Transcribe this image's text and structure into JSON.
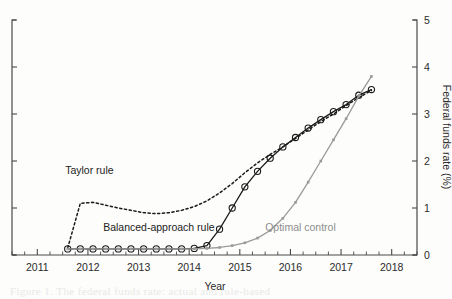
{
  "figure": {
    "background": "#fdfdfc",
    "bleed_text_bottom": "Figure 1. The federal funds rate: actual and rule-based",
    "bleed_text_top": ""
  },
  "chart_data": {
    "type": "line",
    "title": "",
    "xlabel": "Year",
    "ylabel": "Federal funds rate (%)",
    "xlim": [
      2010.5,
      2018.5
    ],
    "ylim": [
      0,
      5
    ],
    "xticks": [
      2011,
      2012,
      2013,
      2014,
      2015,
      2016,
      2017,
      2018
    ],
    "xticklabels": [
      "2011",
      "2012",
      "2013",
      "2014",
      "2015",
      "2016",
      "2017",
      "2018"
    ],
    "x_minor_ticks_per_interval": 4,
    "yticks": [
      0,
      1,
      2,
      3,
      4,
      5
    ],
    "yticklabels": [
      "0",
      "1",
      "2",
      "3",
      "4",
      "5"
    ],
    "y_axis_side": "right",
    "grid": false,
    "legend": "inline-annotations",
    "colors": {
      "taylor_rule": "#1a1a1a",
      "balanced_approach_rule": "#1a1a1a",
      "optimal_control": "#9a9a9a",
      "axis": "#4a4a4a"
    },
    "series": [
      {
        "name": "Taylor rule",
        "style": "dotted",
        "color": "#1a1a1a",
        "marker": "none",
        "label_position": {
          "x": 2011.55,
          "y": 1.72
        },
        "x": [
          2011.6,
          2011.85,
          2012.1,
          2012.35,
          2012.6,
          2012.85,
          2013.1,
          2013.35,
          2013.6,
          2013.85,
          2014.1,
          2014.35,
          2014.6,
          2014.85,
          2015.1,
          2015.35,
          2015.6,
          2015.85,
          2016.1,
          2016.35,
          2016.6,
          2016.85,
          2017.1,
          2017.35,
          2017.6
        ],
        "y": [
          0.15,
          1.1,
          1.12,
          1.06,
          1.0,
          0.95,
          0.9,
          0.88,
          0.9,
          0.95,
          1.03,
          1.15,
          1.32,
          1.52,
          1.75,
          1.96,
          2.14,
          2.3,
          2.48,
          2.66,
          2.84,
          3.0,
          3.18,
          3.35,
          3.5
        ]
      },
      {
        "name": "Balanced-approach rule",
        "style": "solid",
        "color": "#1a1a1a",
        "marker": "circle",
        "label_position": {
          "x": 2012.3,
          "y": 0.52
        },
        "x": [
          2011.6,
          2011.85,
          2012.1,
          2012.35,
          2012.6,
          2012.85,
          2013.1,
          2013.35,
          2013.6,
          2013.85,
          2014.1,
          2014.35,
          2014.6,
          2014.85,
          2015.1,
          2015.35,
          2015.6,
          2015.85,
          2016.1,
          2016.35,
          2016.6,
          2016.85,
          2017.1,
          2017.35,
          2017.6
        ],
        "y": [
          0.13,
          0.13,
          0.13,
          0.13,
          0.13,
          0.13,
          0.13,
          0.13,
          0.13,
          0.13,
          0.14,
          0.2,
          0.55,
          1.0,
          1.45,
          1.78,
          2.06,
          2.3,
          2.5,
          2.7,
          2.88,
          3.05,
          3.2,
          3.4,
          3.52
        ]
      },
      {
        "name": "Optimal control",
        "style": "solid",
        "color": "#9a9a9a",
        "marker": "small-square",
        "label_position": {
          "x": 2015.5,
          "y": 0.52
        },
        "x": [
          2011.6,
          2011.85,
          2012.1,
          2012.35,
          2012.6,
          2012.85,
          2013.1,
          2013.35,
          2013.6,
          2013.85,
          2014.1,
          2014.35,
          2014.6,
          2014.85,
          2015.1,
          2015.35,
          2015.6,
          2015.85,
          2016.1,
          2016.35,
          2016.6,
          2016.85,
          2017.1,
          2017.35,
          2017.6
        ],
        "y": [
          0.13,
          0.13,
          0.13,
          0.13,
          0.13,
          0.13,
          0.13,
          0.13,
          0.13,
          0.13,
          0.13,
          0.14,
          0.16,
          0.2,
          0.26,
          0.36,
          0.52,
          0.78,
          1.12,
          1.55,
          2.0,
          2.45,
          2.9,
          3.38,
          3.8
        ]
      }
    ]
  }
}
